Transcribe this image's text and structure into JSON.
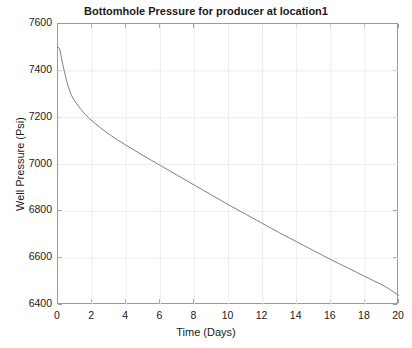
{
  "chart_data": {
    "type": "line",
    "title": "Bottomhole Pressure for producer at location1",
    "xlabel": "Time (Days)",
    "ylabel": "Well Pressure (Psi)",
    "xlim": [
      0,
      20
    ],
    "ylim": [
      6400,
      7600
    ],
    "xticks": [
      0,
      2,
      4,
      6,
      8,
      10,
      12,
      14,
      16,
      18,
      20
    ],
    "yticks": [
      6400,
      6600,
      6800,
      7000,
      7200,
      7400,
      7600
    ],
    "xtick_labels": [
      "0",
      "2",
      "4",
      "6",
      "8",
      "10",
      "12",
      "14",
      "16",
      "18",
      "20"
    ],
    "ytick_labels": [
      "6400",
      "6600",
      "6800",
      "7000",
      "7200",
      "7400",
      "7600"
    ],
    "grid": true,
    "legend": null,
    "legend_position": "none",
    "line_color": "#808080",
    "line_width": 1,
    "series": [
      {
        "name": "Bottomhole Pressure",
        "x": [
          0.0,
          0.1,
          0.2,
          0.3,
          0.4,
          0.5,
          0.6,
          0.7,
          0.8,
          0.9,
          1.0,
          1.2,
          1.4,
          1.6,
          1.8,
          2.0,
          2.5,
          3.0,
          3.5,
          4.0,
          4.5,
          5.0,
          5.5,
          6.0,
          6.5,
          7.0,
          7.5,
          8.0,
          8.5,
          9.0,
          9.5,
          10.0,
          10.5,
          11.0,
          11.5,
          12.0,
          12.5,
          13.0,
          13.5,
          14.0,
          14.5,
          15.0,
          15.5,
          16.0,
          16.5,
          17.0,
          17.5,
          18.0,
          18.5,
          19.0,
          19.5,
          20.0
        ],
        "y": [
          7502,
          7494,
          7456,
          7421,
          7389,
          7360,
          7334,
          7312,
          7294,
          7280,
          7270,
          7249,
          7230,
          7214,
          7199,
          7186,
          7156,
          7129,
          7105,
          7082,
          7060,
          7038,
          7017,
          6996,
          6975,
          6954,
          6933,
          6912,
          6891,
          6870,
          6849,
          6828,
          6808,
          6788,
          6768,
          6748,
          6728,
          6708,
          6689,
          6670,
          6651,
          6632,
          6613,
          6594,
          6576,
          6558,
          6540,
          6522,
          6504,
          6487,
          6465,
          6440
        ]
      }
    ]
  },
  "colors": {
    "background": "#ffffff",
    "axis": "#9a9a9a",
    "grid": "#ededed",
    "text": "#1a1a1a",
    "line": "#808080"
  }
}
